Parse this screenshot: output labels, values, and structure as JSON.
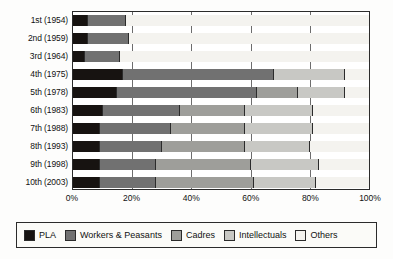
{
  "chart_data": {
    "type": "bar",
    "orientation": "horizontal",
    "stacked": true,
    "stack_mode": "percent",
    "title": "",
    "xlabel": "",
    "ylabel": "",
    "xlim": [
      0,
      100
    ],
    "xticks": [
      "0%",
      "20%",
      "40%",
      "60%",
      "80%",
      "100%"
    ],
    "xtick_values": [
      0,
      20,
      40,
      60,
      80,
      100
    ],
    "grid": true,
    "legend_position": "bottom",
    "categories": [
      "1st (1954)",
      "2nd (1959)",
      "3rd (1964)",
      "4th (1975)",
      "5th (1978)",
      "6th (1983)",
      "7th (1988)",
      "8th (1993)",
      "9th (1998)",
      "10th (2003)"
    ],
    "series": [
      {
        "name": "PLA",
        "color": "#171311",
        "values": [
          5,
          5,
          4,
          17,
          15,
          10,
          9,
          9,
          9,
          9
        ]
      },
      {
        "name": "Workers & Peasants",
        "color": "#717171",
        "values": [
          13,
          14,
          12,
          51,
          47,
          26,
          24,
          21,
          19,
          19
        ]
      },
      {
        "name": "Cadres",
        "color": "#9e9e9a",
        "values": [
          0,
          0,
          0,
          0,
          14,
          22,
          25,
          28,
          32,
          33
        ]
      },
      {
        "name": "Intellectuals",
        "color": "#c8c8c4",
        "values": [
          0,
          0,
          0,
          24,
          16,
          23,
          23,
          22,
          23,
          21
        ]
      },
      {
        "name": "Others",
        "color": "#f4f3ef",
        "values": [
          82,
          81,
          84,
          8,
          8,
          19,
          19,
          20,
          17,
          18
        ]
      }
    ],
    "bars": [
      {
        "category": "1st (1954)",
        "segments": [
          5,
          13,
          0,
          0,
          82
        ]
      },
      {
        "category": "2nd (1959)",
        "segments": [
          5,
          14,
          0,
          0,
          81
        ]
      },
      {
        "category": "3rd (1964)",
        "segments": [
          4,
          12,
          0,
          0,
          84
        ]
      },
      {
        "category": "4th (1975)",
        "segments": [
          17,
          51,
          0,
          24,
          8
        ]
      },
      {
        "category": "5th (1978)",
        "segments": [
          15,
          47,
          14,
          16,
          8
        ]
      },
      {
        "category": "6th (1983)",
        "segments": [
          10,
          26,
          22,
          23,
          19
        ]
      },
      {
        "category": "7th (1988)",
        "segments": [
          9,
          24,
          25,
          23,
          19
        ]
      },
      {
        "category": "8th (1993)",
        "segments": [
          9,
          21,
          28,
          22,
          20
        ]
      },
      {
        "category": "9th (1998)",
        "segments": [
          9,
          19,
          32,
          23,
          17
        ]
      },
      {
        "category": "10th (2003)",
        "segments": [
          9,
          19,
          33,
          21,
          18
        ]
      }
    ],
    "legend": [
      {
        "label": "PLA",
        "color": "#171311"
      },
      {
        "label": "Workers & Peasants",
        "color": "#717171"
      },
      {
        "label": "Cadres",
        "color": "#9e9e9a"
      },
      {
        "label": "Intellectuals",
        "color": "#c8c8c4"
      },
      {
        "label": "Others",
        "color": "#f4f3ef"
      }
    ]
  }
}
